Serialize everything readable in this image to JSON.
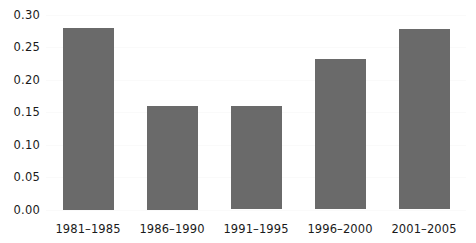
{
  "chart_data": {
    "type": "bar",
    "title": "",
    "subtitle": "",
    "xlabel": "",
    "ylabel": "",
    "categories": [
      "1981–1985",
      "1986–1990",
      "1991–1995",
      "1996–2000",
      "2001–2005"
    ],
    "values": [
      0.28,
      0.16,
      0.159,
      0.232,
      0.277
    ],
    "ylim": [
      0.0,
      0.3
    ],
    "yticks": [
      0.0,
      0.05,
      0.1,
      0.15,
      0.2,
      0.25,
      0.3
    ],
    "ytick_labels": [
      "0.00",
      "0.05",
      "0.10",
      "0.15",
      "0.20",
      "0.25",
      "0.30"
    ],
    "grid": true,
    "legend": null,
    "series": [
      {
        "name": "",
        "values": [
          0.28,
          0.16,
          0.159,
          0.232,
          0.277
        ]
      }
    ],
    "colors": {
      "bar": "#6a6a6a",
      "gridline": "#fafafa",
      "text": "#1a1a1a",
      "background": "#ffffff"
    }
  }
}
